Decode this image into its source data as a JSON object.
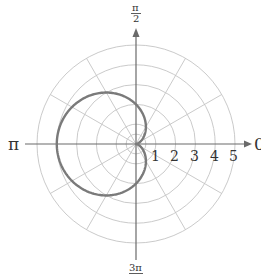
{
  "chart_data": {
    "type": "polar-line",
    "title": "",
    "equation_form": "r = a - a*cos(theta)",
    "parameters": {
      "a": 2
    },
    "series": [
      {
        "name": "cardioid",
        "color": "#7a7a7a",
        "theta_deg": [
          0,
          30,
          60,
          90,
          120,
          150,
          180,
          210,
          240,
          270,
          300,
          330,
          360
        ],
        "r": [
          0,
          0.27,
          1,
          2,
          3,
          3.73,
          4,
          3.73,
          3,
          2,
          1,
          0.27,
          0
        ]
      }
    ],
    "radial_axis": {
      "range": [
        0,
        5
      ],
      "ticks": [
        1,
        2,
        3,
        4,
        5
      ],
      "tick_labels": [
        "1",
        "2",
        "3",
        "4",
        "5"
      ]
    },
    "angular_axis": {
      "spoke_step_deg": 30,
      "labels": [
        {
          "angle_deg": 0,
          "text": "0"
        },
        {
          "angle_deg": 90,
          "num": "π",
          "den": "2"
        },
        {
          "angle_deg": 180,
          "text": "π"
        },
        {
          "angle_deg": 270,
          "num": "3π",
          "den": "2"
        }
      ]
    },
    "grid": true,
    "legend": null
  },
  "labels": {
    "zero": "0",
    "half_pi_num": "π",
    "half_pi_den": "2",
    "pi": "π",
    "three_half_pi_num": "3π",
    "three_half_pi_den": "2",
    "r1": "1",
    "r2": "2",
    "r3": "3",
    "r4": "4",
    "r5": "5"
  },
  "colors": {
    "grid": "#c4c4c4",
    "axis": "#6a6a6a",
    "curve": "#7a7a7a",
    "text": "#333333"
  }
}
